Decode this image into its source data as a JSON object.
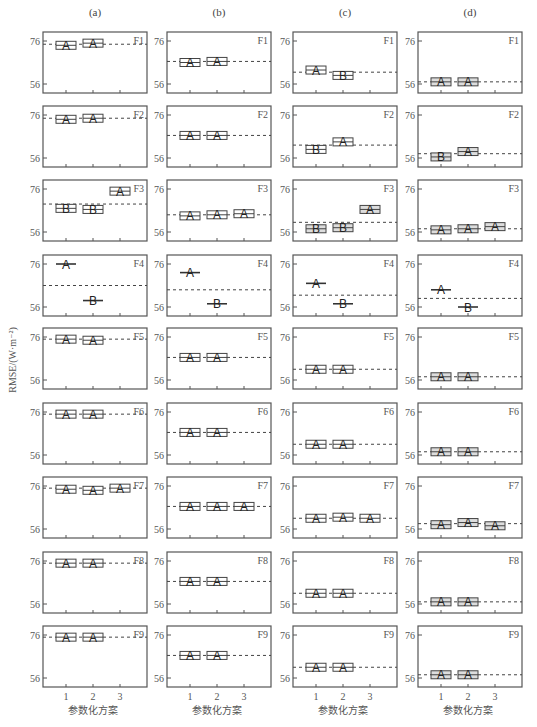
{
  "chart_data": {
    "type": "box",
    "ylabel": "RMSE/(W·m⁻²)",
    "xlabel": "参数化方案",
    "x_ticks": [
      "1",
      "2",
      "3"
    ],
    "y_ticks": [
      56,
      76
    ],
    "ylim": [
      54,
      80
    ],
    "columns": [
      {
        "title": "(a)",
        "panels": [
          {
            "label": "F1",
            "reference": 74.5,
            "boxes": [
              {
                "x": 1,
                "median": 74.0,
                "group": "A"
              },
              {
                "x": 2,
                "median": 75.0,
                "group": "A"
              }
            ]
          },
          {
            "label": "F2",
            "reference": 74.5,
            "boxes": [
              {
                "x": 1,
                "median": 74.0,
                "group": "A"
              },
              {
                "x": 2,
                "median": 74.5,
                "group": "A"
              }
            ]
          },
          {
            "label": "F3",
            "reference": 69.0,
            "boxes": [
              {
                "x": 1,
                "median": 67.0,
                "group": "B"
              },
              {
                "x": 2,
                "median": 66.5,
                "group": "B"
              },
              {
                "x": 3,
                "median": 75.0,
                "group": "A"
              }
            ]
          },
          {
            "label": "F4",
            "reference": 66.0,
            "boxes": [
              {
                "x": 1,
                "median": 76.0,
                "group": "A",
                "thin": true
              },
              {
                "x": 2,
                "median": 59.0,
                "group": "B",
                "thin": true
              }
            ]
          },
          {
            "label": "F5",
            "reference": 75.0,
            "boxes": [
              {
                "x": 1,
                "median": 75.0,
                "group": "A"
              },
              {
                "x": 2,
                "median": 74.5,
                "group": "A"
              }
            ]
          },
          {
            "label": "F6",
            "reference": 75.0,
            "boxes": [
              {
                "x": 1,
                "median": 75.0,
                "group": "A"
              },
              {
                "x": 2,
                "median": 75.0,
                "group": "A"
              }
            ]
          },
          {
            "label": "F7",
            "reference": 75.0,
            "boxes": [
              {
                "x": 1,
                "median": 74.5,
                "group": "A"
              },
              {
                "x": 2,
                "median": 74.0,
                "group": "A"
              },
              {
                "x": 3,
                "median": 75.0,
                "group": "A"
              }
            ]
          },
          {
            "label": "F8",
            "reference": 75.0,
            "boxes": [
              {
                "x": 1,
                "median": 75.0,
                "group": "A"
              },
              {
                "x": 2,
                "median": 75.0,
                "group": "A"
              }
            ]
          },
          {
            "label": "F9",
            "reference": 75.0,
            "boxes": [
              {
                "x": 1,
                "median": 75.0,
                "group": "A"
              },
              {
                "x": 2,
                "median": 75.0,
                "group": "A"
              }
            ]
          }
        ]
      },
      {
        "title": "(b)",
        "panels": [
          {
            "label": "F1",
            "reference": 66.5,
            "boxes": [
              {
                "x": 1,
                "median": 66.0,
                "group": "A"
              },
              {
                "x": 2,
                "median": 66.5,
                "group": "A"
              }
            ]
          },
          {
            "label": "F2",
            "reference": 66.5,
            "boxes": [
              {
                "x": 1,
                "median": 66.5,
                "group": "A"
              },
              {
                "x": 2,
                "median": 66.5,
                "group": "A"
              }
            ]
          },
          {
            "label": "F3",
            "reference": 64.0,
            "boxes": [
              {
                "x": 1,
                "median": 63.5,
                "group": "A"
              },
              {
                "x": 2,
                "median": 64.0,
                "group": "A"
              },
              {
                "x": 3,
                "median": 64.5,
                "group": "A"
              }
            ]
          },
          {
            "label": "F4",
            "reference": 64.0,
            "boxes": [
              {
                "x": 1,
                "median": 72.0,
                "group": "A",
                "thin": true
              },
              {
                "x": 2,
                "median": 57.5,
                "group": "B",
                "thin": true
              }
            ]
          },
          {
            "label": "F5",
            "reference": 66.5,
            "boxes": [
              {
                "x": 1,
                "median": 66.5,
                "group": "A"
              },
              {
                "x": 2,
                "median": 66.5,
                "group": "A"
              }
            ]
          },
          {
            "label": "F6",
            "reference": 66.5,
            "boxes": [
              {
                "x": 1,
                "median": 66.5,
                "group": "A"
              },
              {
                "x": 2,
                "median": 66.5,
                "group": "A"
              }
            ]
          },
          {
            "label": "F7",
            "reference": 66.5,
            "boxes": [
              {
                "x": 1,
                "median": 66.5,
                "group": "A"
              },
              {
                "x": 2,
                "median": 66.5,
                "group": "A"
              },
              {
                "x": 3,
                "median": 66.5,
                "group": "A"
              }
            ]
          },
          {
            "label": "F8",
            "reference": 66.5,
            "boxes": [
              {
                "x": 1,
                "median": 66.5,
                "group": "A"
              },
              {
                "x": 2,
                "median": 66.5,
                "group": "A"
              }
            ]
          },
          {
            "label": "F9",
            "reference": 66.5,
            "boxes": [
              {
                "x": 1,
                "median": 66.5,
                "group": "A"
              },
              {
                "x": 2,
                "median": 66.5,
                "group": "A"
              }
            ]
          }
        ]
      },
      {
        "title": "(c)",
        "panels": [
          {
            "label": "F1",
            "reference": 61.5,
            "boxes": [
              {
                "x": 1,
                "median": 62.5,
                "group": "A"
              },
              {
                "x": 2,
                "median": 60.0,
                "group": "B"
              }
            ]
          },
          {
            "label": "F2",
            "reference": 62.0,
            "boxes": [
              {
                "x": 1,
                "median": 60.0,
                "group": "B"
              },
              {
                "x": 2,
                "median": 63.5,
                "group": "A"
              }
            ]
          },
          {
            "label": "F3",
            "reference": 60.5,
            "boxes": [
              {
                "x": 1,
                "median": 57.5,
                "group": "B"
              },
              {
                "x": 2,
                "median": 58.0,
                "group": "B"
              },
              {
                "x": 3,
                "median": 66.5,
                "group": "A"
              }
            ]
          },
          {
            "label": "F4",
            "reference": 61.5,
            "boxes": [
              {
                "x": 1,
                "median": 67.0,
                "group": "A",
                "thin": true
              },
              {
                "x": 2,
                "median": 57.5,
                "group": "B",
                "thin": true
              }
            ]
          },
          {
            "label": "F5",
            "reference": 61.0,
            "boxes": [
              {
                "x": 1,
                "median": 61.0,
                "group": "A"
              },
              {
                "x": 2,
                "median": 61.0,
                "group": "A"
              }
            ]
          },
          {
            "label": "F6",
            "reference": 61.0,
            "boxes": [
              {
                "x": 1,
                "median": 61.0,
                "group": "A"
              },
              {
                "x": 2,
                "median": 61.0,
                "group": "A"
              }
            ]
          },
          {
            "label": "F7",
            "reference": 61.0,
            "boxes": [
              {
                "x": 1,
                "median": 61.0,
                "group": "A"
              },
              {
                "x": 2,
                "median": 61.5,
                "group": "A"
              },
              {
                "x": 3,
                "median": 61.0,
                "group": "A"
              }
            ]
          },
          {
            "label": "F8",
            "reference": 61.0,
            "boxes": [
              {
                "x": 1,
                "median": 61.0,
                "group": "A"
              },
              {
                "x": 2,
                "median": 61.0,
                "group": "A"
              }
            ]
          },
          {
            "label": "F9",
            "reference": 61.0,
            "boxes": [
              {
                "x": 1,
                "median": 61.0,
                "group": "A"
              },
              {
                "x": 2,
                "median": 61.0,
                "group": "A"
              }
            ]
          }
        ]
      },
      {
        "title": "(d)",
        "panels": [
          {
            "label": "F1",
            "reference": 57.0,
            "boxes": [
              {
                "x": 1,
                "median": 57.0,
                "group": "A"
              },
              {
                "x": 2,
                "median": 57.0,
                "group": "A"
              }
            ]
          },
          {
            "label": "F2",
            "reference": 58.0,
            "boxes": [
              {
                "x": 1,
                "median": 56.5,
                "group": "B"
              },
              {
                "x": 2,
                "median": 59.0,
                "group": "A"
              }
            ]
          },
          {
            "label": "F3",
            "reference": 57.5,
            "boxes": [
              {
                "x": 1,
                "median": 57.0,
                "group": "A"
              },
              {
                "x": 2,
                "median": 57.5,
                "group": "A"
              },
              {
                "x": 3,
                "median": 58.5,
                "group": "A"
              }
            ]
          },
          {
            "label": "F4",
            "reference": 60.0,
            "boxes": [
              {
                "x": 1,
                "median": 64.0,
                "group": "A",
                "thin": true
              },
              {
                "x": 2,
                "median": 56.0,
                "group": "B",
                "thin": true
              }
            ]
          },
          {
            "label": "F5",
            "reference": 57.5,
            "boxes": [
              {
                "x": 1,
                "median": 57.5,
                "group": "A"
              },
              {
                "x": 2,
                "median": 57.5,
                "group": "A"
              }
            ]
          },
          {
            "label": "F6",
            "reference": 57.5,
            "boxes": [
              {
                "x": 1,
                "median": 57.5,
                "group": "A"
              },
              {
                "x": 2,
                "median": 57.5,
                "group": "A"
              }
            ]
          },
          {
            "label": "F7",
            "reference": 58.5,
            "boxes": [
              {
                "x": 1,
                "median": 58.0,
                "group": "A"
              },
              {
                "x": 2,
                "median": 59.0,
                "group": "A"
              },
              {
                "x": 3,
                "median": 57.5,
                "group": "A"
              }
            ]
          },
          {
            "label": "F8",
            "reference": 57.0,
            "boxes": [
              {
                "x": 1,
                "median": 57.0,
                "group": "A"
              },
              {
                "x": 2,
                "median": 57.0,
                "group": "A"
              }
            ]
          },
          {
            "label": "F9",
            "reference": 57.5,
            "boxes": [
              {
                "x": 1,
                "median": 57.5,
                "group": "A"
              },
              {
                "x": 2,
                "median": 57.5,
                "group": "A"
              }
            ]
          }
        ]
      }
    ]
  }
}
